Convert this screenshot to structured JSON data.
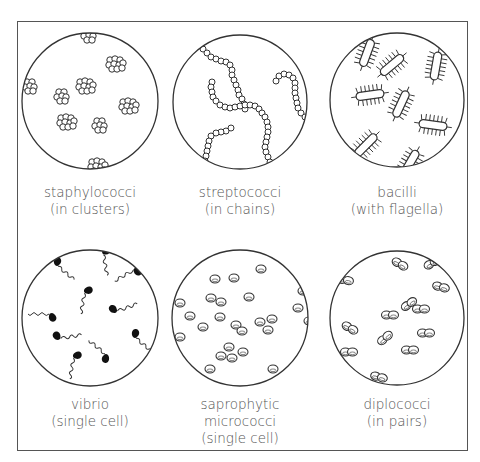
{
  "panels": [
    {
      "id": "staphylococci",
      "lines": [
        "staphylococci",
        "(in clusters)"
      ],
      "cx": 90,
      "cy": 101,
      "r": 68,
      "arrangement": "clusters"
    },
    {
      "id": "streptococci",
      "lines": [
        "streptococci",
        "(in chains)"
      ],
      "cx": 240,
      "cy": 102,
      "r": 67,
      "arrangement": "chains"
    },
    {
      "id": "bacilli",
      "lines": [
        "bacilli",
        "(with flagella)"
      ],
      "cx": 397,
      "cy": 100,
      "r": 67,
      "arrangement": "rods-with-flagella"
    },
    {
      "id": "vibrio",
      "lines": [
        "vibrio",
        "(single cell)"
      ],
      "cx": 90,
      "cy": 318,
      "r": 68,
      "arrangement": "comma-shaped-with-flagellum"
    },
    {
      "id": "saprophytic-micrococci",
      "lines": [
        "saprophytic",
        "micrococci",
        "(single cell)"
      ],
      "cx": 240,
      "cy": 318,
      "r": 68,
      "arrangement": "single-cocci"
    },
    {
      "id": "diplococci",
      "lines": [
        "diplococci",
        "(in pairs)"
      ],
      "cx": 397,
      "cy": 318,
      "r": 67,
      "arrangement": "pairs"
    }
  ],
  "colors": {
    "stroke": "#333333",
    "text": "#555555",
    "background": "#ffffff"
  }
}
